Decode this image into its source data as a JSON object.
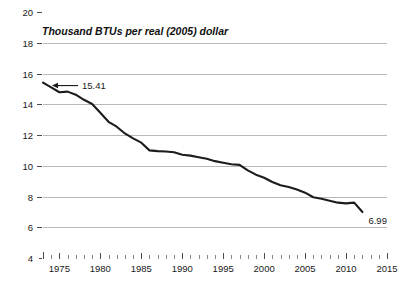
{
  "chart_data": {
    "type": "line",
    "title": "Thousand BTUs per real (2005) dollar",
    "xlabel": "",
    "ylabel": "",
    "xlim": [
      1973,
      2015
    ],
    "ylim": [
      4,
      20
    ],
    "grid": true,
    "legend_position": "none",
    "y_ticks": [
      "20",
      "18",
      "16",
      "14",
      "12",
      "10",
      "8",
      "6",
      "4"
    ],
    "y_tick_values": [
      20,
      18,
      16,
      14,
      12,
      10,
      8,
      6,
      4
    ],
    "x_ticks": [
      "1975",
      "1980",
      "1985",
      "1990",
      "1995",
      "2000",
      "2005",
      "2010",
      "2015"
    ],
    "x_tick_values": [
      1975,
      1980,
      1985,
      1990,
      1995,
      2000,
      2005,
      2010,
      2015
    ],
    "x": [
      1973,
      1974,
      1975,
      1976,
      1977,
      1978,
      1979,
      1980,
      1981,
      1982,
      1983,
      1984,
      1985,
      1986,
      1987,
      1988,
      1989,
      1990,
      1991,
      1992,
      1993,
      1994,
      1995,
      1996,
      1997,
      1998,
      1999,
      2000,
      2001,
      2002,
      2003,
      2004,
      2005,
      2006,
      2007,
      2008,
      2009,
      2010,
      2011,
      2012
    ],
    "values": [
      15.41,
      15.1,
      14.78,
      14.82,
      14.62,
      14.29,
      14.02,
      13.45,
      12.86,
      12.54,
      12.1,
      11.78,
      11.5,
      11.0,
      10.95,
      10.93,
      10.88,
      10.72,
      10.66,
      10.55,
      10.45,
      10.3,
      10.2,
      10.1,
      10.06,
      9.7,
      9.42,
      9.22,
      8.94,
      8.73,
      8.62,
      8.45,
      8.25,
      7.95,
      7.85,
      7.72,
      7.6,
      7.55,
      7.6,
      6.99
    ],
    "series": [
      {
        "name": "Energy intensity",
        "values": [
          15.41,
          15.1,
          14.78,
          14.82,
          14.62,
          14.29,
          14.02,
          13.45,
          12.86,
          12.54,
          12.1,
          11.78,
          11.5,
          11.0,
          10.95,
          10.93,
          10.88,
          10.72,
          10.66,
          10.55,
          10.45,
          10.3,
          10.2,
          10.1,
          10.06,
          9.7,
          9.42,
          9.22,
          8.94,
          8.73,
          8.62,
          8.45,
          8.25,
          7.95,
          7.85,
          7.72,
          7.6,
          7.55,
          7.6,
          6.99
        ]
      }
    ],
    "annotations": [
      {
        "label": "15.41",
        "x": 1973,
        "y": 15.41,
        "kind": "arrow-left"
      },
      {
        "label": "6.99",
        "x": 2012,
        "y": 6.99,
        "kind": "plain-right"
      }
    ],
    "colors": {
      "line": "#1c1c1c",
      "grid": "#b8b8b8",
      "text": "#1a1a1a",
      "background": "#ffffff"
    }
  }
}
